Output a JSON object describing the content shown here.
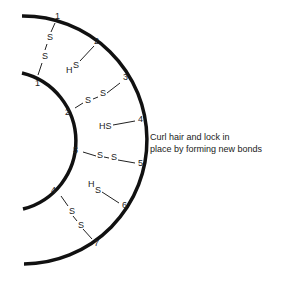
{
  "caption": {
    "line1": "Curl hair and lock in",
    "line2": "place by forming new bonds"
  },
  "outer_strand": {
    "numbers": [
      "1",
      "2",
      "3",
      "4",
      "5",
      "6",
      "7"
    ]
  },
  "inner_strand": {
    "numbers": [
      "1",
      "2",
      "3",
      "4"
    ]
  },
  "bonds": [
    {
      "type": "disulfide",
      "outer": "1",
      "inner": "1",
      "labels": [
        "S",
        "S"
      ]
    },
    {
      "type": "sulfhydryl",
      "outer": "2",
      "labels": [
        "H",
        "S"
      ]
    },
    {
      "type": "disulfide",
      "outer": "3",
      "inner": "2",
      "labels": [
        "S",
        "S"
      ]
    },
    {
      "type": "sulfhydryl",
      "outer": "4",
      "labels": [
        "HS"
      ]
    },
    {
      "type": "disulfide",
      "outer": "5",
      "inner": "3",
      "labels": [
        "S",
        "S"
      ]
    },
    {
      "type": "sulfhydryl",
      "outer": "6",
      "labels": [
        "H",
        "S"
      ]
    },
    {
      "type": "disulfide",
      "outer": "7",
      "inner": "4",
      "labels": [
        "S",
        "S"
      ]
    }
  ]
}
